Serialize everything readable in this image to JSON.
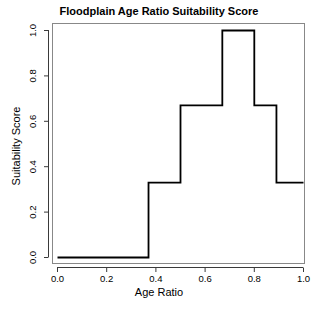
{
  "chart_data": {
    "type": "line",
    "title": "Floodplain Age Ratio Suitability Score",
    "xlabel": "Age Ratio",
    "ylabel": "Suitability Score",
    "xlim": [
      0.0,
      1.0
    ],
    "ylim": [
      0.0,
      1.0
    ],
    "grid": false,
    "legend": null,
    "xticks": [
      "0.0",
      "0.2",
      "0.4",
      "0.6",
      "0.8",
      "1.0"
    ],
    "xtick_values": [
      0.0,
      0.2,
      0.4,
      0.6,
      0.8,
      1.0
    ],
    "yticks": [
      "0.0",
      "0.2",
      "0.4",
      "0.6",
      "0.8",
      "1.0"
    ],
    "ytick_values": [
      0.0,
      0.2,
      0.4,
      0.6,
      0.8,
      1.0
    ],
    "style": "step",
    "line_color": "#000000",
    "steps": [
      {
        "x_start": 0.0,
        "x_end": 0.37,
        "y": 0.0
      },
      {
        "x_start": 0.37,
        "x_end": 0.5,
        "y": 0.33
      },
      {
        "x_start": 0.5,
        "x_end": 0.67,
        "y": 0.67
      },
      {
        "x_start": 0.67,
        "x_end": 0.8,
        "y": 1.0
      },
      {
        "x_start": 0.8,
        "x_end": 0.89,
        "y": 0.67
      },
      {
        "x_start": 0.89,
        "x_end": 1.0,
        "y": 0.33
      }
    ],
    "x": [
      0.0,
      0.37,
      0.37,
      0.5,
      0.5,
      0.67,
      0.67,
      0.8,
      0.8,
      0.89,
      0.89,
      1.0
    ],
    "values": [
      0.0,
      0.0,
      0.33,
      0.33,
      0.67,
      0.67,
      1.0,
      1.0,
      0.67,
      0.67,
      0.33,
      0.33
    ]
  }
}
